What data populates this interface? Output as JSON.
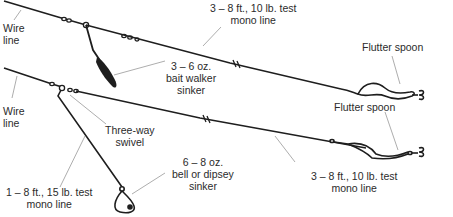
{
  "diagram": {
    "type": "fishing-rig-illustration",
    "colors": {
      "line": "#1e1e1e",
      "leader": "#8a8a8a",
      "text": "#2b2b2b",
      "background": "#ffffff"
    },
    "top_rig": {
      "wire_line": {
        "line1": "Wire",
        "line2": "line"
      },
      "mono_line": {
        "line1": "3 – 8 ft., 10 lb. test",
        "line2": "mono line"
      },
      "sinker": {
        "line1": "3 – 6 oz.",
        "line2": "bait walker",
        "line3": "sinker"
      },
      "lure": {
        "line1": "Flutter spoon"
      }
    },
    "bottom_rig": {
      "wire_line": {
        "line1": "Wire",
        "line2": "line"
      },
      "swivel": {
        "line1": "Three-way",
        "line2": "swivel"
      },
      "dropper_line": {
        "line1": "1 – 8 ft., 15 lb. test",
        "line2": "mono line"
      },
      "sinker": {
        "line1": "6 – 8 oz.",
        "line2": "bell or dipsey",
        "line3": "sinker"
      },
      "mono_line": {
        "line1": "3 – 8 ft., 10 lb. test",
        "line2": "mono line"
      },
      "lure": {
        "line1": "Flutter spoon"
      }
    }
  }
}
